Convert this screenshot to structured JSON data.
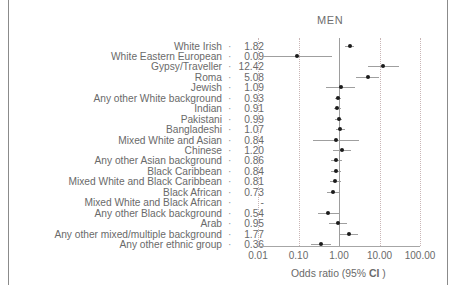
{
  "panel": {
    "title": "MEN"
  },
  "axis": {
    "label_prefix": "Odds ratio (95% ",
    "label_bold": "CI",
    "label_suffix": " )",
    "ticks": [
      "0.01",
      "0.10",
      "1.00",
      "10.00",
      "100.00"
    ],
    "tick_values": [
      0.01,
      0.1,
      1.0,
      10.0,
      100.0
    ],
    "reference_value": "1.00",
    "separator": "·"
  },
  "colors": {
    "marker": "#1b1b1b",
    "ci_line": "#9f9f9f",
    "gridline": "#c9b6b6",
    "refline": "#9d9d9d",
    "text": "#6a6a6a",
    "frame": "#8b8b8b"
  },
  "chart_data": {
    "type": "scatter",
    "title": "MEN",
    "xlabel": "Odds ratio (95% CI )",
    "ylabel": "",
    "xscale": "log",
    "xlim": [
      0.01,
      100.0
    ],
    "xticks": [
      0.01,
      0.1,
      1.0,
      10.0,
      100.0
    ],
    "xticklabels": [
      "0.01",
      "0.10",
      "1.00",
      "10.00",
      "100.00"
    ],
    "grid": true,
    "reference_line": 1.0,
    "legend": "none",
    "categories": [
      "White Irish",
      "White Eastern European",
      "Gypsy/Traveller",
      "Roma",
      "Jewish",
      "Any other White background",
      "Indian",
      "Pakistani",
      "Bangladeshi",
      "Mixed White and Asian",
      "Chinese",
      "Any other Asian background",
      "Black Caribbean",
      "Mixed White and Black Caribbean",
      "Black African",
      "Mixed White and Black African",
      "Any other Black background",
      "Arab",
      "Any other mixed/multiple background",
      "Any other ethnic group"
    ],
    "values": [
      1.82,
      0.09,
      12.42,
      5.08,
      1.09,
      0.93,
      0.91,
      0.99,
      1.07,
      0.84,
      1.2,
      0.86,
      0.84,
      0.81,
      0.73,
      null,
      0.54,
      0.95,
      1.77,
      0.36
    ],
    "value_labels": [
      "1.82",
      "0.09",
      "12.42",
      "5.08",
      "1.09",
      "0.93",
      "0.91",
      "0.99",
      "1.07",
      "0.84",
      "1.20",
      "0.86",
      "0.84",
      "0.81",
      "0.73",
      "-",
      "0.54",
      "0.95",
      "1.77",
      "0.36"
    ],
    "ci_low": [
      1.38,
      0.012,
      5.1,
      2.6,
      0.48,
      0.78,
      0.76,
      0.8,
      0.83,
      0.23,
      0.73,
      0.64,
      0.65,
      0.59,
      0.5,
      null,
      0.3,
      0.56,
      1.05,
      0.2
    ],
    "ci_high": [
      2.41,
      0.66,
      30.2,
      9.9,
      2.48,
      1.11,
      1.09,
      1.22,
      1.38,
      3.05,
      1.97,
      1.16,
      1.09,
      1.11,
      1.06,
      null,
      0.98,
      1.62,
      2.98,
      0.65
    ]
  }
}
